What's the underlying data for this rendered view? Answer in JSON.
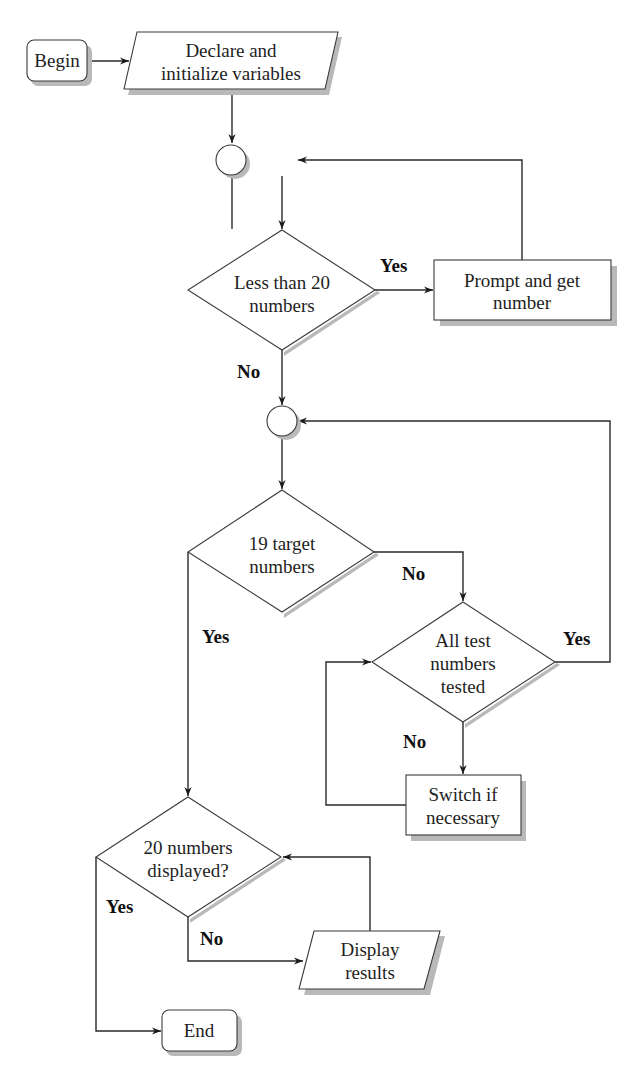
{
  "diagram": {
    "type": "flowchart",
    "nodes": {
      "begin": {
        "label": "Begin",
        "shape": "terminator"
      },
      "declare": {
        "line1": "Declare and",
        "line2": "initialize variables",
        "shape": "io"
      },
      "junction1": {
        "shape": "connector"
      },
      "less_than_20": {
        "line1": "Less than 20",
        "line2": "numbers",
        "shape": "decision"
      },
      "prompt": {
        "line1": "Prompt and get",
        "line2": "number",
        "shape": "process"
      },
      "junction2": {
        "shape": "connector"
      },
      "target_19": {
        "line1": "19 target",
        "line2": "numbers",
        "shape": "decision"
      },
      "all_tested": {
        "line1": "All test",
        "line2": "numbers",
        "line3": "tested",
        "shape": "decision"
      },
      "switch": {
        "line1": "Switch if",
        "line2": "necessary",
        "shape": "process"
      },
      "displayed_20": {
        "line1": "20 numbers",
        "line2": "displayed?",
        "shape": "decision"
      },
      "display_results": {
        "line1": "Display",
        "line2": "results",
        "shape": "io"
      },
      "end": {
        "label": "End",
        "shape": "terminator"
      }
    },
    "edge_labels": {
      "less_than_20_yes": "Yes",
      "less_than_20_no": "No",
      "target_19_no": "No",
      "target_19_yes": "Yes",
      "all_tested_yes": "Yes",
      "all_tested_no": "No",
      "displayed_20_yes": "Yes",
      "displayed_20_no": "No"
    },
    "edges": [
      [
        "begin",
        "declare"
      ],
      [
        "declare",
        "junction1"
      ],
      [
        "junction1",
        "less_than_20"
      ],
      [
        "less_than_20",
        "prompt",
        "Yes"
      ],
      [
        "prompt",
        "junction1"
      ],
      [
        "less_than_20",
        "junction2",
        "No"
      ],
      [
        "junction2",
        "target_19"
      ],
      [
        "target_19",
        "all_tested",
        "No"
      ],
      [
        "all_tested",
        "junction2",
        "Yes"
      ],
      [
        "all_tested",
        "switch",
        "No"
      ],
      [
        "switch",
        "all_tested"
      ],
      [
        "target_19",
        "displayed_20",
        "Yes"
      ],
      [
        "displayed_20",
        "display_results",
        "No"
      ],
      [
        "display_results",
        "displayed_20"
      ],
      [
        "displayed_20",
        "end",
        "Yes"
      ]
    ]
  }
}
